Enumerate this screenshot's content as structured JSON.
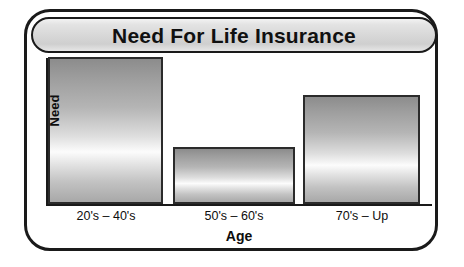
{
  "frame": {
    "border_color": "#1a1a1a",
    "background": "#ffffff"
  },
  "title_banner": {
    "text": "Need For Life Insurance",
    "fill_top": "#f2f2f2",
    "fill_bottom": "#e6e6e6",
    "border_color": "#1a1a1a"
  },
  "chart_data": {
    "type": "bar",
    "title": "Need For Life Insurance",
    "xlabel": "Age",
    "ylabel": "Need",
    "categories": [
      "20's – 40's",
      "50's – 60's",
      "70's – Up"
    ],
    "values": [
      100,
      38,
      74
    ],
    "ylim": [
      0,
      100
    ],
    "grid": false,
    "legend": false,
    "axis_tick_labels_y": [],
    "bar_fill": "gradient-gray-highlight",
    "bar_border_color": "#2b2b2b"
  }
}
